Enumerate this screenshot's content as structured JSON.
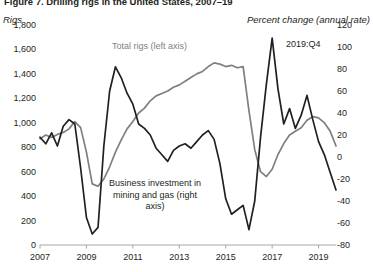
{
  "figure": {
    "title_truncated": "Figure 7. Drilling rigs in the United States, 2007–19",
    "left_axis_unit": "Rigs",
    "right_axis_unit": "Percent change (annual rate)",
    "annotations": {
      "rigs_label": "Total rigs (left axis)",
      "date_label": "2019:Q4",
      "investment_label": "Business investment in mining and gas (right axis)"
    },
    "colors": {
      "rigs_line": "#7f7f7f",
      "investment_line": "#231f20",
      "axis": "#a6a6a6",
      "text": "#231f20"
    }
  },
  "chart_data": {
    "type": "line",
    "title": "Figure 7. Drilling rigs in the United States, 2007–19",
    "xlabel": "",
    "ylabel": "Rigs",
    "y2label": "Percent change (annual rate)",
    "grid": false,
    "legend_position": "in-plot annotations",
    "xlim": [
      2007.0,
      2019.75
    ],
    "ylim": [
      0,
      1800
    ],
    "y2lim": [
      -80,
      120
    ],
    "x_tick_labels": [
      "2007",
      "2009",
      "2011",
      "2013",
      "2015",
      "2017",
      "2019"
    ],
    "x_tick_values": [
      2007,
      2009,
      2011,
      2013,
      2015,
      2017,
      2019
    ],
    "y_tick_labels": [
      "0",
      "200",
      "400",
      "600",
      "800",
      "1,000",
      "1,200",
      "1,400",
      "1,600",
      "1,800"
    ],
    "y_tick_values": [
      0,
      200,
      400,
      600,
      800,
      1000,
      1200,
      1400,
      1600,
      1800
    ],
    "y2_tick_labels": [
      "-80",
      "-60",
      "-40",
      "-20",
      "0",
      "20",
      "40",
      "60",
      "80",
      "100",
      "120"
    ],
    "y2_tick_values": [
      -80,
      -60,
      -40,
      -20,
      0,
      20,
      40,
      60,
      80,
      100,
      120
    ],
    "series": [
      {
        "name": "Total rigs (left axis)",
        "axis": "left",
        "color": "#7f7f7f",
        "x": [
          2007.0,
          2007.25,
          2007.5,
          2007.75,
          2008.0,
          2008.25,
          2008.5,
          2008.75,
          2009.0,
          2009.25,
          2009.5,
          2009.75,
          2010.0,
          2010.25,
          2010.5,
          2010.75,
          2011.0,
          2011.25,
          2011.5,
          2011.75,
          2012.0,
          2012.25,
          2012.5,
          2012.75,
          2013.0,
          2013.25,
          2013.5,
          2013.75,
          2014.0,
          2014.25,
          2014.5,
          2014.75,
          2015.0,
          2015.25,
          2015.5,
          2015.75,
          2016.0,
          2016.25,
          2016.5,
          2016.75,
          2017.0,
          2017.25,
          2017.5,
          2017.75,
          2018.0,
          2018.25,
          2018.5,
          2018.75,
          2019.0,
          2019.25,
          2019.5,
          2019.75
        ],
        "values": [
          870,
          900,
          880,
          905,
          920,
          950,
          1010,
          960,
          760,
          500,
          480,
          540,
          640,
          760,
          860,
          950,
          1010,
          1080,
          1120,
          1180,
          1220,
          1240,
          1260,
          1290,
          1310,
          1340,
          1370,
          1400,
          1420,
          1460,
          1490,
          1480,
          1460,
          1470,
          1450,
          1460,
          1100,
          780,
          600,
          560,
          620,
          740,
          830,
          900,
          930,
          960,
          1020,
          1050,
          1040,
          1000,
          930,
          810
        ]
      },
      {
        "name": "Business investment in mining and gas (right axis)",
        "axis": "right",
        "color": "#231f20",
        "x": [
          2007.0,
          2007.25,
          2007.5,
          2007.75,
          2008.0,
          2008.25,
          2008.5,
          2008.75,
          2009.0,
          2009.25,
          2009.5,
          2009.75,
          2010.0,
          2010.25,
          2010.5,
          2010.75,
          2011.0,
          2011.25,
          2011.5,
          2011.75,
          2012.0,
          2012.25,
          2012.5,
          2012.75,
          2013.0,
          2013.25,
          2013.5,
          2013.75,
          2014.0,
          2014.25,
          2014.5,
          2014.75,
          2015.0,
          2015.25,
          2015.5,
          2015.75,
          2016.0,
          2016.25,
          2016.5,
          2016.75,
          2017.0,
          2017.25,
          2017.5,
          2017.75,
          2018.0,
          2018.25,
          2018.5,
          2018.75,
          2019.0,
          2019.25,
          2019.5,
          2019.75
        ],
        "values": [
          18,
          12,
          22,
          10,
          28,
          34,
          30,
          -10,
          -55,
          -70,
          -64,
          10,
          60,
          82,
          72,
          58,
          48,
          30,
          26,
          20,
          8,
          2,
          -4,
          6,
          10,
          12,
          8,
          14,
          20,
          24,
          16,
          -6,
          -38,
          -52,
          -48,
          -44,
          -66,
          -40,
          18,
          66,
          108,
          62,
          30,
          44,
          26,
          38,
          56,
          34,
          14,
          2,
          -14,
          -30
        ]
      }
    ]
  }
}
